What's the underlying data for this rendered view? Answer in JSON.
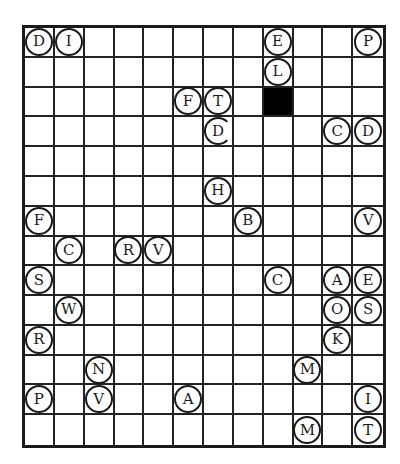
{
  "puzzle": {
    "rows": 14,
    "cols": 12,
    "black_cells": [
      {
        "row": 2,
        "col": 8
      }
    ],
    "tokens": [
      {
        "row": 0,
        "col": 0,
        "letter": "D"
      },
      {
        "row": 0,
        "col": 1,
        "letter": "I"
      },
      {
        "row": 0,
        "col": 8,
        "letter": "E"
      },
      {
        "row": 0,
        "col": 11,
        "letter": "P"
      },
      {
        "row": 1,
        "col": 8,
        "letter": "L"
      },
      {
        "row": 2,
        "col": 5,
        "letter": "F"
      },
      {
        "row": 2,
        "col": 6,
        "letter": "T"
      },
      {
        "row": 3,
        "col": 6,
        "letter": "D",
        "broken": true
      },
      {
        "row": 3,
        "col": 10,
        "letter": "C"
      },
      {
        "row": 3,
        "col": 11,
        "letter": "D"
      },
      {
        "row": 5,
        "col": 6,
        "letter": "H"
      },
      {
        "row": 6,
        "col": 0,
        "letter": "F"
      },
      {
        "row": 6,
        "col": 7,
        "letter": "B"
      },
      {
        "row": 6,
        "col": 11,
        "letter": "V"
      },
      {
        "row": 7,
        "col": 1,
        "letter": "C"
      },
      {
        "row": 7,
        "col": 3,
        "letter": "R"
      },
      {
        "row": 7,
        "col": 4,
        "letter": "V"
      },
      {
        "row": 8,
        "col": 0,
        "letter": "S"
      },
      {
        "row": 8,
        "col": 8,
        "letter": "C"
      },
      {
        "row": 8,
        "col": 10,
        "letter": "A"
      },
      {
        "row": 8,
        "col": 11,
        "letter": "E"
      },
      {
        "row": 9,
        "col": 1,
        "letter": "W"
      },
      {
        "row": 9,
        "col": 10,
        "letter": "O"
      },
      {
        "row": 9,
        "col": 11,
        "letter": "S"
      },
      {
        "row": 10,
        "col": 0,
        "letter": "R"
      },
      {
        "row": 10,
        "col": 10,
        "letter": "K"
      },
      {
        "row": 11,
        "col": 2,
        "letter": "N"
      },
      {
        "row": 11,
        "col": 9,
        "letter": "M"
      },
      {
        "row": 12,
        "col": 0,
        "letter": "P"
      },
      {
        "row": 12,
        "col": 2,
        "letter": "V"
      },
      {
        "row": 12,
        "col": 5,
        "letter": "A"
      },
      {
        "row": 12,
        "col": 11,
        "letter": "I"
      },
      {
        "row": 13,
        "col": 9,
        "letter": "M"
      },
      {
        "row": 13,
        "col": 11,
        "letter": "T"
      }
    ]
  },
  "colors": {
    "grid_line": "#222222",
    "black_cell": "#000000",
    "background": "#ffffff"
  }
}
